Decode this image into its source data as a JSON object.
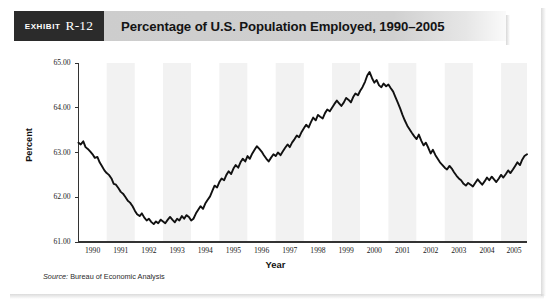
{
  "exhibit": {
    "word": "Exhibit",
    "number": "R-12"
  },
  "header": {
    "title": "Percentage of U.S. Population Employed, 1990–2005"
  },
  "source": {
    "lead": "Source:",
    "text": " Bureau of Economic Analysis"
  },
  "colors": {
    "badge_bg": "#2b2b2b",
    "title_bar_bg": "#cdcdcd",
    "line": "#111111",
    "band": "#f2f2f2",
    "axis": "#333333",
    "page_bg": "#ffffff"
  },
  "chart_data": {
    "type": "line",
    "title": "Percentage of U.S. Population Employed, 1990–2005",
    "xlabel": "Year",
    "ylabel": "Percent",
    "ylim": [
      61.0,
      65.0
    ],
    "xlim": [
      1990.0,
      2005.92
    ],
    "grid": false,
    "legend": null,
    "alternating_year_bands": true,
    "ytick_labels": [
      "61.00",
      "62.00",
      "63.00",
      "64.00",
      "65.00"
    ],
    "ytick_values": [
      61.0,
      62.0,
      63.0,
      64.0,
      65.0
    ],
    "xtick_labels": [
      "1990",
      "1991",
      "1992",
      "1993",
      "1994",
      "1995",
      "1996",
      "1997",
      "1998",
      "1999",
      "2000",
      "2001",
      "2002",
      "2003",
      "2004",
      "2005"
    ],
    "xtick_values": [
      1990,
      1991,
      1992,
      1993,
      1994,
      1995,
      1996,
      1997,
      1998,
      1999,
      2000,
      2001,
      2002,
      2003,
      2004,
      2005
    ],
    "series": [
      {
        "name": "Percentage of U.S. population employed",
        "x": [
          1990.0,
          1990.08,
          1990.17,
          1990.25,
          1990.33,
          1990.42,
          1990.5,
          1990.58,
          1990.67,
          1990.75,
          1990.83,
          1990.92,
          1991.0,
          1991.08,
          1991.17,
          1991.25,
          1991.33,
          1991.42,
          1991.5,
          1991.58,
          1991.67,
          1991.75,
          1991.83,
          1991.92,
          1992.0,
          1992.08,
          1992.17,
          1992.25,
          1992.33,
          1992.42,
          1992.5,
          1992.58,
          1992.67,
          1992.75,
          1992.83,
          1992.92,
          1993.0,
          1993.08,
          1993.17,
          1993.25,
          1993.33,
          1993.42,
          1993.5,
          1993.58,
          1993.67,
          1993.75,
          1993.83,
          1993.92,
          1994.0,
          1994.08,
          1994.17,
          1994.25,
          1994.33,
          1994.42,
          1994.5,
          1994.58,
          1994.67,
          1994.75,
          1994.83,
          1994.92,
          1995.0,
          1995.08,
          1995.17,
          1995.25,
          1995.33,
          1995.42,
          1995.5,
          1995.58,
          1995.67,
          1995.75,
          1995.83,
          1995.92,
          1996.0,
          1996.08,
          1996.17,
          1996.25,
          1996.33,
          1996.42,
          1996.5,
          1996.58,
          1996.67,
          1996.75,
          1996.83,
          1996.92,
          1997.0,
          1997.08,
          1997.17,
          1997.25,
          1997.33,
          1997.42,
          1997.5,
          1997.58,
          1997.67,
          1997.75,
          1997.83,
          1997.92,
          1998.0,
          1998.08,
          1998.17,
          1998.25,
          1998.33,
          1998.42,
          1998.5,
          1998.58,
          1998.67,
          1998.75,
          1998.83,
          1998.92,
          1999.0,
          1999.08,
          1999.17,
          1999.25,
          1999.33,
          1999.42,
          1999.5,
          1999.58,
          1999.67,
          1999.75,
          1999.83,
          1999.92,
          2000.0,
          2000.08,
          2000.17,
          2000.25,
          2000.33,
          2000.42,
          2000.5,
          2000.58,
          2000.67,
          2000.75,
          2000.83,
          2000.92,
          2001.0,
          2001.08,
          2001.17,
          2001.25,
          2001.33,
          2001.42,
          2001.5,
          2001.58,
          2001.67,
          2001.75,
          2001.83,
          2001.92,
          2002.0,
          2002.08,
          2002.17,
          2002.25,
          2002.33,
          2002.42,
          2002.5,
          2002.58,
          2002.67,
          2002.75,
          2002.83,
          2002.92,
          2003.0,
          2003.08,
          2003.17,
          2003.25,
          2003.33,
          2003.42,
          2003.5,
          2003.58,
          2003.67,
          2003.75,
          2003.83,
          2003.92,
          2004.0,
          2004.08,
          2004.17,
          2004.25,
          2004.33,
          2004.42,
          2004.5,
          2004.58,
          2004.67,
          2004.75,
          2004.83,
          2004.92,
          2005.0,
          2005.08,
          2005.17,
          2005.25,
          2005.33,
          2005.42,
          2005.5,
          2005.58,
          2005.67,
          2005.75,
          2005.83,
          2005.92
        ],
        "y": [
          63.22,
          63.18,
          63.25,
          63.12,
          63.08,
          63.02,
          62.96,
          62.88,
          62.9,
          62.78,
          62.7,
          62.6,
          62.54,
          62.5,
          62.42,
          62.3,
          62.28,
          62.2,
          62.12,
          62.08,
          62.0,
          61.92,
          61.88,
          61.8,
          61.7,
          61.62,
          61.58,
          61.64,
          61.55,
          61.48,
          61.52,
          61.45,
          61.4,
          61.46,
          61.42,
          61.5,
          61.46,
          61.42,
          61.5,
          61.56,
          61.5,
          61.44,
          61.52,
          61.48,
          61.58,
          61.52,
          61.6,
          61.56,
          61.48,
          61.52,
          61.64,
          61.72,
          61.8,
          61.74,
          61.86,
          61.94,
          62.02,
          62.14,
          62.26,
          62.22,
          62.34,
          62.42,
          62.38,
          62.5,
          62.58,
          62.52,
          62.64,
          62.72,
          62.66,
          62.78,
          62.86,
          62.8,
          62.92,
          62.86,
          62.98,
          63.06,
          63.14,
          63.08,
          63.02,
          62.94,
          62.86,
          62.8,
          62.88,
          62.96,
          62.92,
          63.0,
          62.94,
          63.02,
          63.1,
          63.18,
          63.12,
          63.22,
          63.3,
          63.38,
          63.34,
          63.46,
          63.54,
          63.62,
          63.56,
          63.68,
          63.78,
          63.72,
          63.84,
          63.8,
          63.76,
          63.88,
          63.96,
          63.92,
          64.0,
          64.08,
          64.16,
          64.1,
          64.04,
          64.12,
          64.22,
          64.18,
          64.12,
          64.24,
          64.32,
          64.28,
          64.38,
          64.46,
          64.58,
          64.72,
          64.8,
          64.66,
          64.56,
          64.62,
          64.5,
          64.46,
          64.54,
          64.48,
          64.52,
          64.44,
          64.36,
          64.24,
          64.12,
          63.98,
          63.84,
          63.72,
          63.6,
          63.52,
          63.44,
          63.36,
          63.3,
          63.4,
          63.26,
          63.16,
          63.22,
          63.1,
          62.98,
          63.06,
          62.94,
          62.86,
          62.78,
          62.72,
          62.66,
          62.62,
          62.7,
          62.64,
          62.56,
          62.48,
          62.42,
          62.38,
          62.3,
          62.26,
          62.32,
          62.28,
          62.24,
          62.32,
          62.4,
          62.34,
          62.28,
          62.36,
          62.44,
          62.38,
          62.46,
          62.4,
          62.34,
          62.42,
          62.5,
          62.44,
          62.52,
          62.6,
          62.54,
          62.62,
          62.7,
          62.78,
          62.72,
          62.84,
          62.92,
          62.96
        ]
      }
    ],
    "annotations": {
      "start_value": 63.22,
      "early_trough": 61.4,
      "early_trough_year": 1992,
      "peak_value": 64.8,
      "peak_year": 2000,
      "late_trough": 62.24,
      "late_trough_year": 2004,
      "end_value": 62.96
    }
  }
}
